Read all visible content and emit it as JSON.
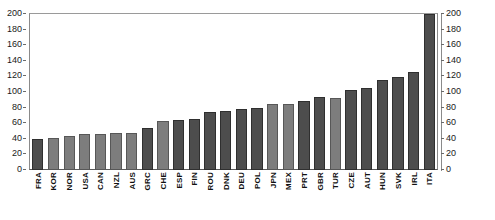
{
  "chart_data": {
    "type": "bar",
    "title": "",
    "subtitle": "",
    "xlabel": "",
    "ylabel": "",
    "ylim": [
      0,
      200
    ],
    "grid": false,
    "legend": null,
    "y_ticks": [
      200,
      180,
      160,
      140,
      120,
      100,
      80,
      60,
      40,
      20,
      0
    ],
    "categories": [
      "FRA",
      "KOR",
      "NOR",
      "USA",
      "CAN",
      "NZL",
      "AUS",
      "GRC",
      "CHE",
      "ESP",
      "FIN",
      "ROU",
      "DNK",
      "DEU",
      "POL",
      "JPN",
      "MEX",
      "PRT",
      "GBR",
      "TUR",
      "CZE",
      "AUT",
      "HUN",
      "SVK",
      "IRL",
      "ITA"
    ],
    "values": [
      40,
      41,
      43,
      46,
      46,
      48,
      48,
      54,
      63,
      64,
      65,
      75,
      76,
      78,
      80,
      84,
      85,
      88,
      93,
      92,
      103,
      105,
      116,
      119,
      126,
      200
    ],
    "bar_shades": [
      "dark",
      "light",
      "light",
      "light",
      "light",
      "light",
      "light",
      "dark",
      "light",
      "dark",
      "dark",
      "dark",
      "dark",
      "dark",
      "dark",
      "light",
      "light",
      "dark",
      "dark",
      "light",
      "dark",
      "dark",
      "dark",
      "dark",
      "dark",
      "dark"
    ],
    "colors": {
      "bar_dark": "#4d4d4d",
      "bar_light": "#7d7d7d",
      "axis": "#6a6a6a",
      "text": "#111111",
      "background": "#ffffff"
    }
  }
}
